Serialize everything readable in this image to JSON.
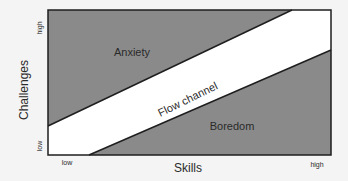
{
  "diagram": {
    "type": "flow-channel",
    "regions": [
      {
        "label": "Anxiety",
        "color": "#8a8a8a"
      },
      {
        "label": "Flow channel",
        "color": "#ffffff"
      },
      {
        "label": "Boredom",
        "color": "#8a8a8a"
      }
    ],
    "x_axis": {
      "title": "Skills",
      "low": "low",
      "high": "high"
    },
    "y_axis": {
      "title": "Challenges",
      "low": "low",
      "high": "high"
    },
    "colors": {
      "region_fill": "#8a8a8a",
      "channel_fill": "#ffffff",
      "line": "#1e1e1e",
      "background": "#f4f4f4"
    }
  }
}
